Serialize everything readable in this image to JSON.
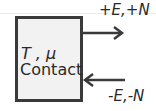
{
  "diagram": {
    "box": {
      "params_label": "T , μ",
      "title": "Contact"
    },
    "arrows": [
      {
        "label": "+E,+N",
        "direction": "out"
      },
      {
        "label": "-E,-N",
        "direction": "in"
      }
    ]
  }
}
